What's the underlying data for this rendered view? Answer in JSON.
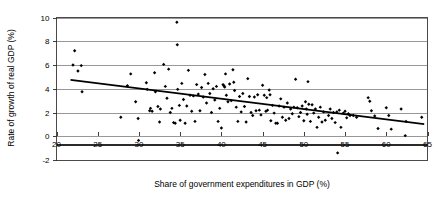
{
  "chart_data": {
    "type": "scatter",
    "title": "",
    "xlabel": "Share of government expenditures in GDP (%)",
    "ylabel": "Rate of growth of real GDP (%)",
    "xlim": [
      20,
      65
    ],
    "ylim": [
      -2,
      10
    ],
    "xticks": [
      20,
      25,
      30,
      35,
      40,
      45,
      50,
      55,
      60,
      65
    ],
    "yticks": [
      -2,
      0,
      2,
      4,
      6,
      8,
      10
    ],
    "xtick_labels": [
      "20",
      "25",
      "30",
      "35",
      "40",
      "45",
      "50",
      "55",
      "60",
      "65"
    ],
    "ytick_labels": [
      "-2",
      "0",
      "2",
      "4",
      "6",
      "8",
      "10"
    ],
    "grid": "horizontal",
    "gridline_values": [
      0,
      2,
      4,
      6,
      8,
      10
    ],
    "legend": "none",
    "marker": "filled-diamond",
    "marker_color": "#000000",
    "series": [
      {
        "name": "countries",
        "points": [
          [
            22.0,
            6.0
          ],
          [
            22.2,
            7.2
          ],
          [
            22.6,
            5.5
          ],
          [
            23.0,
            5.95
          ],
          [
            23.1,
            3.75
          ],
          [
            27.8,
            1.6
          ],
          [
            28.6,
            4.25
          ],
          [
            29.0,
            5.25
          ],
          [
            29.6,
            2.9
          ],
          [
            29.9,
            1.5
          ],
          [
            29.95,
            -0.35
          ],
          [
            30.9,
            4.5
          ],
          [
            31.0,
            3.95
          ],
          [
            31.3,
            2.15
          ],
          [
            31.4,
            2.35
          ],
          [
            31.6,
            2.1
          ],
          [
            31.9,
            5.35
          ],
          [
            32.0,
            3.75
          ],
          [
            32.3,
            2.5
          ],
          [
            32.5,
            1.2
          ],
          [
            32.6,
            2.3
          ],
          [
            33.0,
            6.05
          ],
          [
            33.2,
            4.2
          ],
          [
            33.4,
            3.2
          ],
          [
            33.6,
            5.65
          ],
          [
            33.8,
            2.0
          ],
          [
            34.0,
            2.35
          ],
          [
            34.2,
            1.15
          ],
          [
            34.4,
            1.1
          ],
          [
            34.6,
            9.6
          ],
          [
            34.65,
            7.7
          ],
          [
            34.7,
            3.95
          ],
          [
            34.9,
            2.6
          ],
          [
            35.0,
            1.35
          ],
          [
            35.2,
            4.45
          ],
          [
            35.4,
            3.1
          ],
          [
            35.6,
            1.1
          ],
          [
            35.8,
            2.55
          ],
          [
            36.0,
            5.55
          ],
          [
            36.2,
            3.45
          ],
          [
            36.4,
            2.1
          ],
          [
            36.6,
            3.4
          ],
          [
            36.8,
            1.25
          ],
          [
            37.0,
            4.35
          ],
          [
            37.2,
            3.55
          ],
          [
            37.4,
            2.15
          ],
          [
            37.6,
            4.1
          ],
          [
            37.8,
            3.3
          ],
          [
            38.0,
            5.2
          ],
          [
            38.2,
            2.8
          ],
          [
            38.4,
            4.45
          ],
          [
            38.6,
            3.6
          ],
          [
            38.8,
            2.0
          ],
          [
            39.0,
            4.0
          ],
          [
            39.2,
            3.05
          ],
          [
            39.4,
            4.2
          ],
          [
            39.6,
            1.25
          ],
          [
            39.8,
            2.35
          ],
          [
            40.0,
            0.7
          ],
          [
            40.2,
            4.35
          ],
          [
            40.3,
            4.25
          ],
          [
            40.4,
            4.15
          ],
          [
            40.5,
            5.25
          ],
          [
            40.6,
            3.45
          ],
          [
            40.8,
            2.9
          ],
          [
            41.0,
            4.4
          ],
          [
            41.2,
            3.0
          ],
          [
            41.4,
            5.6
          ],
          [
            41.5,
            4.55
          ],
          [
            41.6,
            3.85
          ],
          [
            41.8,
            2.45
          ],
          [
            42.0,
            1.25
          ],
          [
            42.2,
            3.35
          ],
          [
            42.4,
            2.05
          ],
          [
            42.6,
            3.6
          ],
          [
            42.8,
            2.5
          ],
          [
            43.0,
            1.2
          ],
          [
            43.2,
            4.85
          ],
          [
            43.4,
            3.35
          ],
          [
            43.6,
            2.0
          ],
          [
            43.8,
            1.75
          ],
          [
            44.0,
            3.3
          ],
          [
            44.2,
            2.15
          ],
          [
            44.4,
            3.5
          ],
          [
            44.6,
            2.2
          ],
          [
            44.8,
            1.8
          ],
          [
            45.0,
            4.3
          ],
          [
            45.2,
            3.45
          ],
          [
            45.4,
            2.1
          ],
          [
            45.5,
            3.25
          ],
          [
            45.6,
            2.2
          ],
          [
            45.8,
            3.9
          ],
          [
            45.9,
            3.5
          ],
          [
            46.0,
            1.3
          ],
          [
            46.2,
            2.6
          ],
          [
            46.4,
            1.95
          ],
          [
            46.6,
            1.1
          ],
          [
            46.8,
            1.1
          ],
          [
            47.0,
            2.55
          ],
          [
            47.2,
            3.15
          ],
          [
            47.4,
            1.6
          ],
          [
            47.6,
            2.45
          ],
          [
            47.8,
            1.35
          ],
          [
            48.0,
            2.8
          ],
          [
            48.2,
            1.5
          ],
          [
            48.4,
            2.3
          ],
          [
            48.6,
            1.9
          ],
          [
            48.8,
            2.45
          ],
          [
            49.0,
            4.8
          ],
          [
            49.2,
            2.4
          ],
          [
            49.4,
            1.65
          ],
          [
            49.6,
            2.0
          ],
          [
            49.8,
            2.55
          ],
          [
            50.0,
            1.3
          ],
          [
            50.2,
            2.9
          ],
          [
            50.3,
            2.3
          ],
          [
            50.4,
            1.85
          ],
          [
            50.5,
            4.6
          ],
          [
            50.6,
            2.7
          ],
          [
            50.8,
            1.25
          ],
          [
            51.0,
            2.65
          ],
          [
            51.2,
            1.95
          ],
          [
            51.4,
            2.3
          ],
          [
            51.6,
            0.75
          ],
          [
            51.8,
            1.6
          ],
          [
            52.0,
            2.45
          ],
          [
            52.2,
            1.2
          ],
          [
            52.4,
            2.05
          ],
          [
            52.6,
            1.35
          ],
          [
            53.0,
            1.75
          ],
          [
            53.2,
            2.3
          ],
          [
            53.4,
            1.5
          ],
          [
            53.6,
            2.0
          ],
          [
            53.8,
            1.15
          ],
          [
            54.0,
            2.05
          ],
          [
            54.1,
            -1.4
          ],
          [
            54.3,
            2.2
          ],
          [
            54.5,
            0.75
          ],
          [
            54.8,
            1.95
          ],
          [
            55.0,
            2.1
          ],
          [
            55.2,
            1.55
          ],
          [
            55.4,
            1.9
          ],
          [
            55.6,
            1.75
          ],
          [
            56.0,
            1.75
          ],
          [
            56.4,
            1.6
          ],
          [
            57.8,
            3.25
          ],
          [
            58.0,
            2.95
          ],
          [
            58.2,
            2.15
          ],
          [
            58.6,
            1.7
          ],
          [
            59.0,
            0.65
          ],
          [
            60.0,
            2.4
          ],
          [
            60.3,
            1.75
          ],
          [
            60.6,
            0.6
          ],
          [
            61.8,
            2.3
          ],
          [
            62.3,
            0.05
          ],
          [
            62.4,
            1.25
          ],
          [
            64.3,
            1.6
          ]
        ]
      }
    ],
    "trendline": {
      "type": "linear-fit",
      "x_start": 21.7,
      "y_start": 4.75,
      "x_end": 64.6,
      "y_end": 1.02
    }
  }
}
